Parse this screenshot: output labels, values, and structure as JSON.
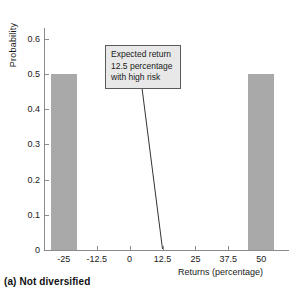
{
  "caption": "(a) Not diversified",
  "annotation": {
    "line1": "Expected return",
    "line2": "12.5 percentage",
    "line3": "with high risk",
    "target_x": 12.5,
    "target_y": 0
  },
  "chart_data": {
    "type": "bar",
    "title": "",
    "xlabel": "Returns (percentage)",
    "ylabel": "Probability",
    "categories": [
      "-25",
      "50"
    ],
    "x": [
      -25,
      50
    ],
    "values": [
      0.5,
      0.5
    ],
    "bar_width": 10,
    "xlim": [
      -32.5,
      57.5
    ],
    "ylim": [
      0,
      0.63
    ],
    "xticks": [
      "-25",
      "-12.5",
      "0",
      "12.5",
      "25",
      "37.5",
      "50"
    ],
    "xtick_values": [
      -25,
      -12.5,
      0,
      12.5,
      25,
      37.5,
      50
    ],
    "yticks": [
      "0",
      "0.1",
      "0.2",
      "0.3",
      "0.4",
      "0.5",
      "0.6"
    ],
    "ytick_values": [
      0,
      0.1,
      0.2,
      0.3,
      0.4,
      0.5,
      0.6
    ],
    "grid": false,
    "legend": false,
    "bar_color": "#a9a9a9",
    "axis_color": "#8b8b8b",
    "annotations": [
      {
        "text": "Expected return 12.5 percentage with high risk",
        "points_to_x": 12.5,
        "points_to_y": 0
      }
    ]
  }
}
